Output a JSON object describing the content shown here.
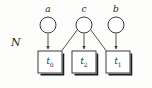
{
  "diagram": {
    "type": "probabilistic-graphical-model",
    "plate_label": "N",
    "stroke_color": "#3a3a3a",
    "shadow_color": "#1a1a1a",
    "background_color": "#fdfdfc",
    "variable_nodes": [
      {
        "id": "a",
        "label": "a",
        "shape": "circle",
        "cx": 48,
        "cy": 25,
        "r": 8
      },
      {
        "id": "c",
        "label": "c",
        "shape": "circle",
        "cx": 84,
        "cy": 25,
        "r": 8
      },
      {
        "id": "b",
        "label": "b",
        "shape": "circle",
        "cx": 116,
        "cy": 25,
        "r": 8
      }
    ],
    "factor_nodes": [
      {
        "id": "t0",
        "label": "t",
        "sub": "0",
        "shape": "square",
        "x": 38,
        "y": 51,
        "w": 24,
        "h": 22
      },
      {
        "id": "t2",
        "label": "t",
        "sub": "2",
        "shape": "square",
        "x": 72,
        "y": 51,
        "w": 24,
        "h": 22
      },
      {
        "id": "t1",
        "label": "t",
        "sub": "1",
        "shape": "square",
        "x": 106,
        "y": 51,
        "w": 24,
        "h": 22
      }
    ],
    "edges": [
      {
        "from": "a",
        "to": "t0",
        "arrow": true
      },
      {
        "from": "c",
        "to": "t0",
        "arrow": false
      },
      {
        "from": "c",
        "to": "t2",
        "arrow": true
      },
      {
        "from": "c",
        "to": "t1",
        "arrow": false
      },
      {
        "from": "b",
        "to": "t1",
        "arrow": true
      }
    ]
  }
}
